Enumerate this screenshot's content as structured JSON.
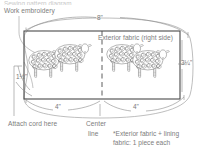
{
  "diagram": {
    "title_cropped": "Sewing pattern diagram",
    "labels": {
      "work_embroidery": "Work embroidery",
      "exterior_fabric": "Exterior fabric (right side)",
      "attach_cord": "Attach cord here",
      "center": "Center",
      "center_line": "line"
    },
    "dimensions": {
      "top_width": "8\"",
      "right_height": "3¼\"",
      "left_height": "1½\"",
      "bottom_left_width": "4\"",
      "bottom_right_width": "4\""
    },
    "note": {
      "line1": "*Exterior fabric + lining",
      "line2": "fabric: 1 piece each"
    },
    "colors": {
      "line": "#555555",
      "text": "#7d7d7d",
      "guide": "#8a8a8a",
      "background": "#ffffff"
    },
    "illustration": {
      "motif": "sheep",
      "count_left_panel": 2,
      "count_right_panel": 2
    }
  }
}
